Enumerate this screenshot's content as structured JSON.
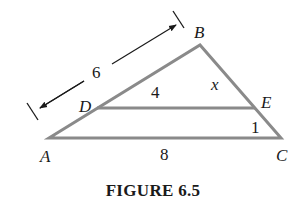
{
  "figure": {
    "caption": "FIGURE 6.5",
    "line_color": "#8a8a8a",
    "dimension_color": "#1a1a1a"
  },
  "points": {
    "A": {
      "label": "A",
      "x": 49,
      "y": 138
    },
    "B": {
      "label": "B",
      "x": 200,
      "y": 45
    },
    "C": {
      "label": "C",
      "x": 281,
      "y": 138
    },
    "D": {
      "label": "D",
      "x": 97,
      "y": 108
    },
    "E": {
      "label": "E",
      "x": 255,
      "y": 108
    }
  },
  "segment_labels": {
    "AB_total": "6",
    "DB": "4",
    "BE": "x",
    "EC": "1",
    "AC": "8"
  }
}
